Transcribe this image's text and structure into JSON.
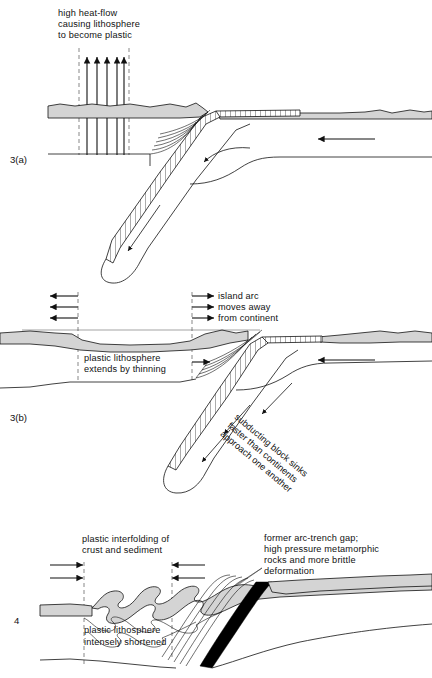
{
  "figure": {
    "background_color": "#ffffff",
    "ink_color": "#111111",
    "crust_fill_color": "#d4d4d4",
    "slab_fill_color": "#ffffff",
    "metamorphic_fill_color": "#000000"
  },
  "panels": [
    {
      "id": "panel-3a",
      "number": "3(a)",
      "labels": {
        "heat_flow": {
          "lines": [
            "high heat-flow",
            "causing lithosphere",
            "to become plastic"
          ],
          "arrow_count": 5,
          "arrow_direction": "up"
        }
      },
      "arrows": [
        {
          "name": "convergence-arrow-right",
          "direction": "left",
          "style": "solid-heavy"
        },
        {
          "name": "mantle-flow-arrow",
          "direction": "down-left",
          "style": "curved"
        },
        {
          "name": "slab-descent-arrow",
          "direction": "down-left",
          "style": "solid"
        }
      ]
    },
    {
      "id": "panel-3b",
      "number": "3(b)",
      "labels": {
        "island_arc": {
          "lines": [
            "island arc",
            "moves away",
            "from continent"
          ],
          "arrow_count": 3,
          "arrow_direction": "right"
        },
        "extension_left": {
          "arrow_count": 3,
          "arrow_direction": "left"
        },
        "plastic_lithosphere": {
          "lines": [
            "plastic lithosphere",
            "extends by thinning"
          ]
        },
        "subducting_block": {
          "lines": [
            "subducting block sinks",
            "faster than continents",
            "approach one another"
          ],
          "rotation_deg": 40
        }
      },
      "arrows": [
        {
          "name": "convergence-arrow-right",
          "direction": "left",
          "style": "solid-heavy"
        },
        {
          "name": "slab-sink-arrow-1",
          "direction": "down-left",
          "style": "solid"
        },
        {
          "name": "slab-sink-arrow-2",
          "direction": "down-left",
          "style": "solid"
        },
        {
          "name": "slab-sink-arrow-3",
          "direction": "down-left",
          "style": "solid"
        }
      ]
    },
    {
      "id": "panel-4",
      "number": "4",
      "labels": {
        "interfolding": {
          "lines": [
            "plastic interfolding of",
            "crust and sediment"
          ]
        },
        "arc_trench_gap": {
          "lines": [
            "former arc-trench gap;",
            "high pressure metamorphic",
            "rocks and more brittle",
            "deformation"
          ]
        },
        "shortened": {
          "lines": [
            "plastic lithosphere",
            "intensely shortened"
          ]
        }
      },
      "arrows": [
        {
          "name": "shortening-arrow-left-1",
          "direction": "right",
          "style": "solid"
        },
        {
          "name": "shortening-arrow-left-2",
          "direction": "right",
          "style": "solid"
        },
        {
          "name": "shortening-arrow-right-1",
          "direction": "left",
          "style": "solid"
        },
        {
          "name": "shortening-arrow-right-2",
          "direction": "left",
          "style": "solid"
        }
      ]
    }
  ]
}
